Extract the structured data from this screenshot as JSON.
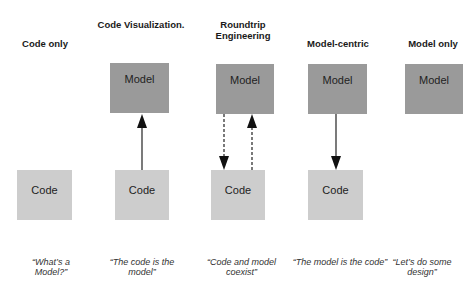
{
  "columns": [
    {
      "title": "Code only",
      "model_label": null,
      "code_label": "Code",
      "quote": "“What’s a Model?”",
      "arrows": []
    },
    {
      "title": "Code Visualization.",
      "model_label": "Model",
      "code_label": "Code",
      "quote": "“The code is the model”",
      "arrows": [
        "code-to-model"
      ]
    },
    {
      "title": "Roundtrip Engineering",
      "model_label": "Model",
      "code_label": "Code",
      "quote": "“Code and model coexist”",
      "arrows": [
        "model-to-code-dashed",
        "code-to-model-dashed"
      ]
    },
    {
      "title": "Model-centric",
      "model_label": "Model",
      "code_label": "Code",
      "quote": "“The model is the code”",
      "arrows": [
        "model-to-code"
      ]
    },
    {
      "title": "Model only",
      "model_label": "Model",
      "code_label": null,
      "quote": "“Let’s do some design”",
      "arrows": []
    }
  ],
  "colors": {
    "model_box": "#9a9a9a",
    "code_box": "#cdcdcd",
    "arrow": "#222222"
  }
}
